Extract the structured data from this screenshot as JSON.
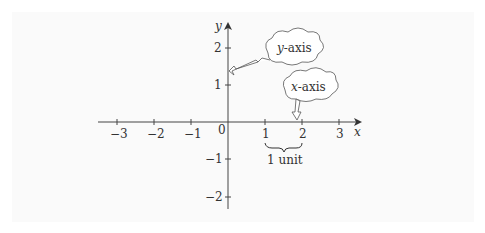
{
  "diagram": {
    "type": "coordinate-plane",
    "x_axis": {
      "label": "x",
      "ticks": [
        {
          "value": -3,
          "label": "−3"
        },
        {
          "value": -2,
          "label": "−2"
        },
        {
          "value": -1,
          "label": "−1"
        },
        {
          "value": 1,
          "label": "1"
        },
        {
          "value": 2,
          "label": "2"
        },
        {
          "value": 3,
          "label": "3"
        }
      ]
    },
    "y_axis": {
      "label": "y",
      "ticks": [
        {
          "value": 2,
          "label": "2"
        },
        {
          "value": 1,
          "label": "1"
        },
        {
          "value": -1,
          "label": "−1"
        },
        {
          "value": -2,
          "label": "−2"
        }
      ]
    },
    "origin_label": "0",
    "callouts": {
      "y_axis": {
        "var": "y",
        "text": "-axis"
      },
      "x_axis": {
        "var": "x",
        "text": "-axis"
      }
    },
    "brace_label": "1 unit",
    "colors": {
      "axis": "#444444",
      "text": "#333333",
      "background": "#fafafa"
    }
  }
}
